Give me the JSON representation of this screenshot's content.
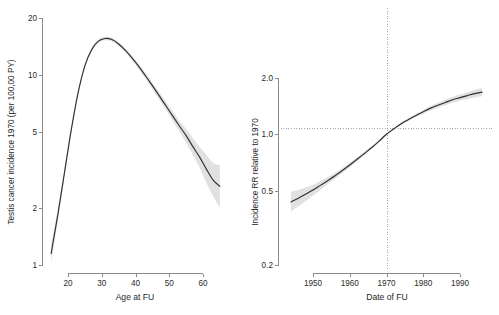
{
  "figure": {
    "background_color": "#ffffff",
    "curve_color": "#2f2f2f",
    "ci_band_color": "#d6d6d6",
    "axis_color": "#8a8a8a",
    "reference_line_color": "#9a9a9a"
  },
  "chart_data": [
    {
      "type": "line",
      "panel": "left",
      "title": "",
      "xlabel": "Age at FU",
      "ylabel": "Testis cancer incidence 1970 (per 100,00 PY)",
      "xlim": [
        15,
        65
      ],
      "ylim": [
        1,
        20
      ],
      "yscale": "log",
      "xscale": "linear",
      "grid": false,
      "legend": "none",
      "xticks": [
        20,
        30,
        40,
        50,
        60
      ],
      "xtick_labels": [
        "20",
        "30",
        "40",
        "50",
        "60"
      ],
      "yticks": [
        1,
        2,
        5,
        10,
        20
      ],
      "ytick_labels": [
        "1",
        "2",
        "5",
        "10",
        "20"
      ],
      "series": [
        {
          "name": "Testis cancer incidence 1970",
          "x": [
            15,
            17,
            19,
            21,
            23,
            25,
            27,
            29,
            31,
            33,
            35,
            37,
            39,
            41,
            43,
            45,
            47,
            49,
            51,
            53,
            55,
            57,
            59,
            61,
            63,
            65
          ],
          "values": [
            1.15,
            1.85,
            3.1,
            5.2,
            8.1,
            11.2,
            13.6,
            15.1,
            15.6,
            15.4,
            14.6,
            13.5,
            12.3,
            11.1,
            9.9,
            8.8,
            7.8,
            6.9,
            6.1,
            5.4,
            4.8,
            4.2,
            3.7,
            3.2,
            2.8,
            2.6
          ],
          "ci_lower": [
            1.02,
            1.72,
            2.95,
            5.0,
            7.85,
            10.9,
            13.25,
            14.75,
            15.25,
            15.05,
            14.25,
            13.15,
            11.95,
            10.75,
            9.55,
            8.45,
            7.45,
            6.55,
            5.75,
            5.05,
            4.4,
            3.8,
            3.25,
            2.7,
            2.3,
            2.0
          ],
          "ci_upper": [
            1.3,
            1.98,
            3.26,
            5.4,
            8.35,
            11.5,
            13.95,
            15.45,
            15.95,
            15.75,
            14.95,
            13.85,
            12.65,
            11.45,
            10.25,
            9.15,
            8.15,
            7.25,
            6.45,
            5.75,
            5.2,
            4.65,
            4.2,
            3.8,
            3.45,
            3.35
          ]
        }
      ]
    },
    {
      "type": "line",
      "panel": "right",
      "title": "",
      "xlabel": "Date of FU",
      "ylabel": "Incidence RR relative to 1970",
      "xlim": [
        1944,
        1996
      ],
      "ylim": [
        0.2,
        2.0
      ],
      "yscale": "log",
      "xscale": "linear",
      "grid": false,
      "legend": "none",
      "xticks": [
        1950,
        1960,
        1970,
        1980,
        1990
      ],
      "xtick_labels": [
        "1950",
        "1960",
        "1970",
        "1980",
        "1990"
      ],
      "yticks": [
        0.2,
        0.5,
        1.0,
        2.0
      ],
      "ytick_labels": [
        "0.2",
        "0.5",
        "1.0",
        "2.0"
      ],
      "reference_lines": [
        {
          "orientation": "vertical",
          "value": 1970,
          "style": "dotted"
        },
        {
          "orientation": "horizontal",
          "value": 1.0,
          "style": "dotted"
        }
      ],
      "series": [
        {
          "name": "Incidence RR relative to 1970",
          "x": [
            1944,
            1946,
            1948,
            1950,
            1952,
            1954,
            1956,
            1958,
            1960,
            1962,
            1964,
            1966,
            1968,
            1970,
            1972,
            1974,
            1976,
            1978,
            1980,
            1982,
            1984,
            1986,
            1988,
            1990,
            1992,
            1994,
            1996
          ],
          "values": [
            0.435,
            0.455,
            0.478,
            0.503,
            0.533,
            0.565,
            0.6,
            0.64,
            0.685,
            0.735,
            0.79,
            0.85,
            0.92,
            1.0,
            1.07,
            1.14,
            1.2,
            1.26,
            1.32,
            1.38,
            1.43,
            1.48,
            1.53,
            1.57,
            1.61,
            1.65,
            1.68
          ],
          "ci_lower": [
            0.385,
            0.412,
            0.44,
            0.47,
            0.504,
            0.54,
            0.578,
            0.62,
            0.666,
            0.717,
            0.774,
            0.836,
            0.906,
            0.988,
            1.055,
            1.122,
            1.18,
            1.236,
            1.29,
            1.342,
            1.388,
            1.432,
            1.474,
            1.51,
            1.542,
            1.572,
            1.596
          ],
          "ci_upper": [
            0.492,
            0.503,
            0.519,
            0.538,
            0.563,
            0.591,
            0.623,
            0.661,
            0.704,
            0.753,
            0.806,
            0.864,
            0.934,
            1.012,
            1.085,
            1.158,
            1.221,
            1.285,
            1.35,
            1.418,
            1.474,
            1.53,
            1.588,
            1.634,
            1.68,
            1.73,
            1.768
          ]
        }
      ]
    }
  ]
}
